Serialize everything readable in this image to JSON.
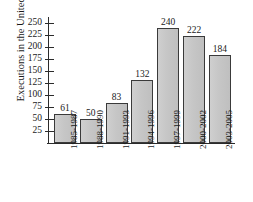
{
  "chart_data": {
    "type": "bar",
    "title": "",
    "subtitle": "",
    "xlabel": "",
    "ylabel": "Executions in the United States",
    "categories": [
      "1985-1987",
      "1988-1990",
      "1991-1993",
      "1994-1996",
      "1997-1999",
      "2000-2002",
      "2003-2005"
    ],
    "values": [
      61,
      50,
      83,
      132,
      240,
      222,
      184
    ],
    "value_labels": [
      "61",
      "50",
      "83",
      "132",
      "240",
      "222",
      "184"
    ],
    "ylim": [
      0,
      262
    ],
    "yticks": [
      25,
      50,
      75,
      100,
      125,
      150,
      175,
      200,
      225,
      250
    ],
    "ytick_labels": [
      "25",
      "50",
      "75",
      "100",
      "125",
      "150",
      "175",
      "200",
      "225",
      "250"
    ],
    "grid": false,
    "legend": false,
    "legend_position": "none",
    "bar_fill_color": "#c6c6c6",
    "bar_edge_color": "#3a3a3a",
    "axis_color": "#2b2b2b",
    "background_color": "#ffffff"
  }
}
